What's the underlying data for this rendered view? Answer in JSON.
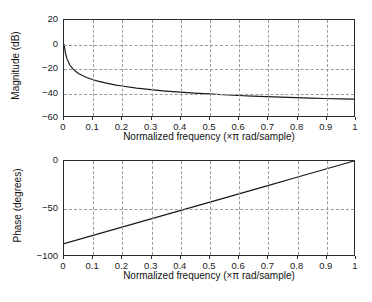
{
  "figure": {
    "title": "",
    "background": "#ffffff",
    "axis_color": "#2b2b2b",
    "grid_color": "#9a9a9a",
    "curve_color": "#1a1a1a"
  },
  "chart_data": [
    {
      "type": "line",
      "title": "Magnitude response",
      "panel": "magnitude",
      "xlabel": "Normalized frequency (×π rad/sample)",
      "ylabel": "Magnitude (dB)",
      "xlim": [
        0,
        1
      ],
      "ylim": [
        -60,
        20
      ],
      "grid": true,
      "legend": "none",
      "xticks": [
        0,
        0.1,
        0.2,
        0.3,
        0.4,
        0.5,
        0.6,
        0.7,
        0.8,
        0.9,
        1
      ],
      "xticklabels": [
        "0",
        "0.1",
        "0.2",
        "0.3",
        "0.4",
        "0.5",
        "0.6",
        "0.7",
        "0.8",
        "0.9",
        "1"
      ],
      "yticks": [
        20,
        0,
        -20,
        -40,
        -60
      ],
      "yticklabels": [
        "20",
        "0",
        "−20",
        "−40",
        "−60"
      ],
      "series": [
        {
          "name": "Magnitude (dB)",
          "x": [
            0,
            0.005,
            0.01,
            0.02,
            0.03,
            0.04,
            0.05,
            0.06,
            0.08,
            0.1,
            0.12,
            0.15,
            0.18,
            0.2,
            0.25,
            0.3,
            0.35,
            0.4,
            0.45,
            0.5,
            0.55,
            0.6,
            0.65,
            0.7,
            0.75,
            0.8,
            0.85,
            0.9,
            0.95,
            1
          ],
          "values": [
            0,
            -7.5,
            -12.2,
            -17.5,
            -20.6,
            -22.8,
            -24.5,
            -25.9,
            -28.1,
            -29.8,
            -31.1,
            -32.8,
            -34.2,
            -35.0,
            -36.7,
            -38.1,
            -39.2,
            -40.1,
            -40.9,
            -41.6,
            -42.3,
            -42.9,
            -43.4,
            -43.9,
            -44.3,
            -44.7,
            -45.1,
            -45.4,
            -45.7,
            -46.0
          ]
        }
      ]
    },
    {
      "type": "line",
      "title": "Phase response",
      "panel": "phase",
      "xlabel": "Normalized frequency (×π rad/sample)",
      "ylabel": "Phase (degrees)",
      "xlim": [
        0,
        1
      ],
      "ylim": [
        -100,
        0
      ],
      "grid": true,
      "legend": "none",
      "xticks": [
        0,
        0.1,
        0.2,
        0.3,
        0.4,
        0.5,
        0.6,
        0.7,
        0.8,
        0.9,
        1
      ],
      "xticklabels": [
        "0",
        "0.1",
        "0.2",
        "0.3",
        "0.4",
        "0.5",
        "0.6",
        "0.7",
        "0.8",
        "0.9",
        "1"
      ],
      "yticks": [
        0,
        -50,
        -100
      ],
      "yticklabels": [
        "0",
        "−50",
        "−100"
      ],
      "series": [
        {
          "name": "Phase (degrees)",
          "x": [
            0,
            0.1,
            0.2,
            0.3,
            0.4,
            0.5,
            0.6,
            0.7,
            0.8,
            0.9,
            1
          ],
          "values": [
            -88,
            -79.2,
            -70.4,
            -61.6,
            -52.8,
            -44,
            -35.2,
            -26.4,
            -17.6,
            -8.8,
            0
          ]
        }
      ]
    }
  ]
}
